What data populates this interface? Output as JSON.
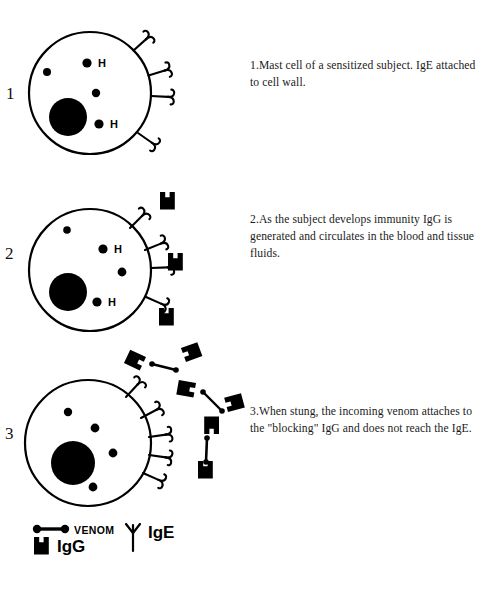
{
  "figure": {
    "background_color": "#ffffff",
    "ink_color": "#000000"
  },
  "panels": [
    {
      "number": "1",
      "caption": "1.Mast cell of a sensitized subject. IgE attached to cell wall.",
      "cell": {
        "nucleus_label": "nucleus",
        "granule_labels": [
          "H",
          "H"
        ],
        "receptor_count": 4,
        "receptor_name": "IgE"
      }
    },
    {
      "number": "2",
      "caption": "2.As the subject develops immunity IgG is generated and circulates in the blood and tissue fluids.",
      "cell": {
        "nucleus_label": "nucleus",
        "granule_labels": [
          "H",
          "H"
        ],
        "receptor_count": 4,
        "receptor_name": "IgE"
      },
      "free_igg_count": 3
    },
    {
      "number": "3",
      "caption": "3.When stung, the incoming venom attaches to the \"blocking\" IgG and does not reach the IgE.",
      "cell": {
        "nucleus_label": "nucleus",
        "granule_labels": [],
        "receptor_count": 5,
        "receptor_name": "IgE"
      },
      "venom_igg_complex_count": 3
    }
  ],
  "legend": {
    "items": [
      {
        "symbol": "venom-dumbbell",
        "label": "VENOM"
      },
      {
        "symbol": "igg-cup",
        "label": "IgG"
      },
      {
        "symbol": "ige-y",
        "label": "IgE"
      }
    ],
    "venom_label": "VENOM",
    "igg_label": "IgG",
    "ige_label": "IgE"
  }
}
